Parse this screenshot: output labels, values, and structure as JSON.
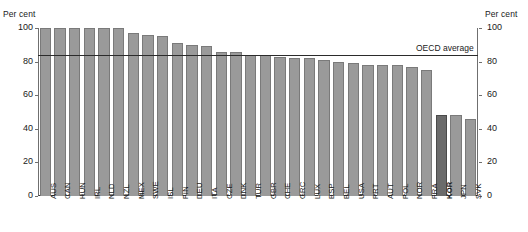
{
  "axes": {
    "unit_label_left": "Per cent",
    "unit_label_right": "Per cent",
    "yticks": [
      100,
      80,
      60,
      40,
      20,
      0
    ],
    "ymin": 0,
    "ymax": 100
  },
  "annotation": {
    "average_label": "OECD average",
    "average_value": 84
  },
  "chart_data": {
    "type": "bar",
    "title": "",
    "xlabel": "",
    "ylabel": "Per cent",
    "ylim": [
      0,
      100
    ],
    "grid": false,
    "legend": "none",
    "orientation": "vertical",
    "bar_color": "#9a9a9a",
    "highlight_color": "#6b6b6b",
    "highlight_category": "KOR",
    "reference_line": {
      "label": "OECD average",
      "value": 84
    },
    "categories": [
      "AUS",
      "CAN",
      "HUN",
      "IRL",
      "NLD",
      "NZL",
      "MEX",
      "SWE",
      "ISL",
      "FIN",
      "DEU",
      "ITA",
      "CZE",
      "DNK",
      "TUR",
      "GBR",
      "CHE",
      "GRC",
      "LUX",
      "ESP",
      "BEL",
      "USA",
      "PRT",
      "AUT",
      "POL",
      "NOR",
      "FRA",
      "KOR",
      "JPN",
      "SVK"
    ],
    "values": [
      100,
      100,
      100,
      100,
      100,
      100,
      97,
      96,
      95,
      91,
      90,
      89,
      86,
      86,
      84,
      84,
      83,
      82,
      82,
      81,
      80,
      79,
      78,
      78,
      78,
      77,
      75,
      48,
      48,
      46
    ]
  }
}
